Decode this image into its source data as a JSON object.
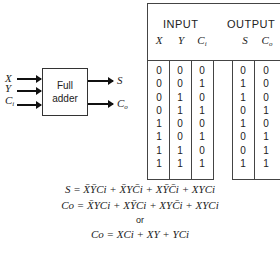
{
  "diagram": {
    "block_label_line1": "Full",
    "block_label_line2": "adder",
    "inputs": [
      {
        "name": "X",
        "sub": ""
      },
      {
        "name": "Y",
        "sub": ""
      },
      {
        "name": "C",
        "sub": "i"
      }
    ],
    "outputs": [
      {
        "name": "S",
        "sub": ""
      },
      {
        "name": "C",
        "sub": "o"
      }
    ]
  },
  "truth_table": {
    "group_headers": [
      "INPUT",
      "OUTPUT"
    ],
    "columns": [
      {
        "name": "X",
        "sub": ""
      },
      {
        "name": "Y",
        "sub": ""
      },
      {
        "name": "C",
        "sub": "i"
      },
      {
        "name": "S",
        "sub": ""
      },
      {
        "name": "C",
        "sub": "o"
      }
    ],
    "col_X": "0\n0\n0\n0\n1\n1\n1\n1",
    "col_Y": "0\n0\n1\n1\n0\n0\n1\n1",
    "col_Ci": "0\n1\n0\n1\n0\n1\n0\n1",
    "col_S": "0\n1\n1\n0\n1\n0\n0\n1",
    "col_Co": "0\n0\n0\n1\n0\n1\n1\n1",
    "rows": [
      [
        0,
        0,
        0,
        0,
        0
      ],
      [
        0,
        0,
        1,
        1,
        0
      ],
      [
        0,
        1,
        0,
        1,
        0
      ],
      [
        0,
        1,
        1,
        0,
        1
      ],
      [
        1,
        0,
        0,
        1,
        0
      ],
      [
        1,
        0,
        1,
        0,
        1
      ],
      [
        1,
        1,
        0,
        0,
        1
      ],
      [
        1,
        1,
        1,
        1,
        1
      ]
    ]
  },
  "equations": {
    "sum": "S = X̄ȲCi + X̄YC̄i + XȲC̄i + XYCi",
    "carry_full": "Co = X̄YCi + XȲCi + XYC̄i + XYCi",
    "or_text": "or",
    "carry_simplified": "Co = XCi + XY + YCi"
  }
}
